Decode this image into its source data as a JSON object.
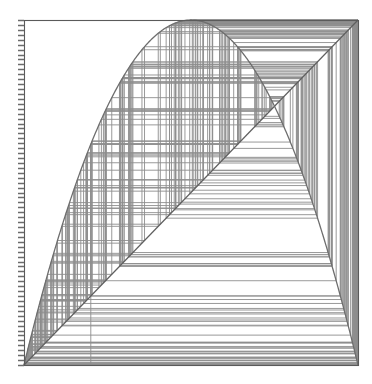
{
  "figure": {
    "title": "Cobweb diagram of the logistic map",
    "background_color": "#ffffff",
    "width": 372,
    "height": 384
  },
  "plot_area": {
    "left": 24,
    "top": 20,
    "right": 358,
    "bottom": 365,
    "frame_color": "#5a5a5a",
    "frame_width": 1.1
  },
  "axis": {
    "name": "left-axis-ticks",
    "side": "left",
    "tick_count": 70,
    "tick_length": 6,
    "tick_color": "#6b6b6b",
    "tick_width": 1.4,
    "labels": []
  },
  "chart_data": {
    "type": "line",
    "title": "Cobweb diagram of the logistic map",
    "subtitle": "",
    "xlabel": "",
    "ylabel": "",
    "xlim": [
      0,
      1
    ],
    "ylim": [
      0,
      1
    ],
    "grid": false,
    "legend": "none",
    "annotations": [],
    "tick_labels": {
      "x": [],
      "y": []
    },
    "map": {
      "name": "logistic",
      "formula": "f(x) = r * x * (1 - x)",
      "r": 4.0,
      "x0": 0.2,
      "iterations": 260
    },
    "series": [
      {
        "name": "parabola",
        "kind": "function-curve",
        "color": "#6e6e6e",
        "width": 1.3,
        "samples": 400,
        "x": [
          0.0,
          0.05,
          0.1,
          0.15,
          0.2,
          0.25,
          0.3,
          0.35,
          0.4,
          0.45,
          0.5,
          0.55,
          0.6,
          0.65,
          0.7,
          0.75,
          0.8,
          0.85,
          0.9,
          0.95,
          1.0
        ],
        "values": [
          0.0,
          0.19,
          0.36,
          0.51,
          0.64,
          0.75,
          0.84,
          0.91,
          0.96,
          0.99,
          1.0,
          0.99,
          0.96,
          0.91,
          0.84,
          0.75,
          0.64,
          0.51,
          0.36,
          0.19,
          0.0
        ]
      },
      {
        "name": "identity",
        "kind": "diagonal",
        "color": "#5f5f5f",
        "width": 1.2,
        "x": [
          0.0,
          1.0
        ],
        "values": [
          0.0,
          1.0
        ]
      },
      {
        "name": "cobweb-trace",
        "kind": "staircase",
        "color": "#8d8d8d",
        "width": 0.9,
        "x0": 0.2,
        "steps": 260
      }
    ]
  }
}
